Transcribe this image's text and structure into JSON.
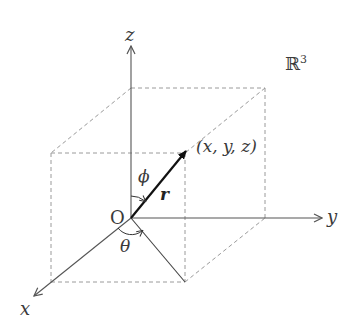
{
  "diagram": {
    "space_label": "ℝ",
    "space_exponent": "3",
    "axes": {
      "x": "x",
      "y": "y",
      "z": "z"
    },
    "origin_label": "O",
    "vector_label": "r",
    "point_label": "(x, y, z)",
    "angles": {
      "polar": "ϕ",
      "azimuth": "θ"
    },
    "colors": {
      "axis": "#555555",
      "vector": "#111111",
      "dashed": "#999999",
      "text": "#3a3a3a"
    }
  }
}
